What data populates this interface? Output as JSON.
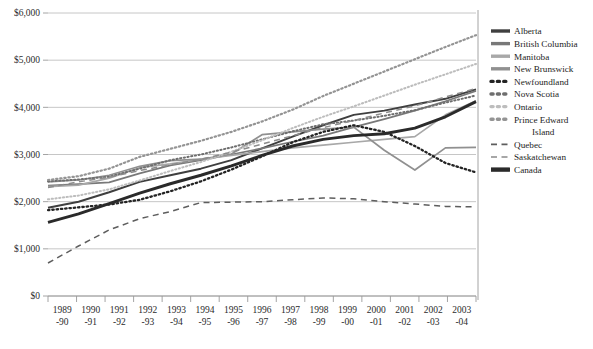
{
  "chart_data": {
    "type": "line",
    "title": "",
    "xlabel": "",
    "ylabel": "",
    "ylim": [
      0,
      6000
    ],
    "ytick_values": [
      0,
      1000,
      2000,
      3000,
      4000,
      5000,
      6000
    ],
    "ytick_labels": [
      "$0",
      "$1,000",
      "$2,000",
      "$3,000",
      "$4,000",
      "$5,000",
      "$6,000"
    ],
    "grid": true,
    "legend_position": "right",
    "categories": [
      "1989–90",
      "1990–91",
      "1991–92",
      "1992–93",
      "1993–94",
      "1994–95",
      "1995–96",
      "1996–97",
      "1997–98",
      "1998–99",
      "1999–00",
      "2000–01",
      "2001–02",
      "2002–03",
      "2003–04"
    ],
    "xtick_top": [
      "1989",
      "1990",
      "1991",
      "1992",
      "1993",
      "1994",
      "1995",
      "1996",
      "1997",
      "1998",
      "1999",
      "2000",
      "2001",
      "2002",
      "2003"
    ],
    "xtick_bottom": [
      "-90",
      "-91",
      "-92",
      "-93",
      "-94",
      "-95",
      "-96",
      "-97",
      "-98",
      "-99",
      "-00",
      "-01",
      "-02",
      "-03",
      "-04"
    ],
    "series": [
      {
        "name": "Alberta",
        "style": "solid",
        "color": "#3f3f3f",
        "width": 2.0,
        "values": [
          1870,
          2000,
          2200,
          2420,
          2560,
          2700,
          2880,
          3130,
          3380,
          3620,
          3840,
          3930,
          4060,
          4180,
          4380
        ]
      },
      {
        "name": "British Columbia",
        "style": "solid",
        "color": "#787878",
        "width": 1.7,
        "values": [
          2340,
          2370,
          2410,
          2600,
          2770,
          2880,
          3000,
          3130,
          3270,
          3400,
          3580,
          3750,
          3930,
          4130,
          4350
        ]
      },
      {
        "name": "Manitoba",
        "style": "solid",
        "color": "#a8a8a8",
        "width": 1.7,
        "values": [
          2320,
          2350,
          2500,
          2720,
          2800,
          2900,
          2980,
          3060,
          3140,
          3200,
          3260,
          3320,
          3380,
          3840,
          4140
        ]
      },
      {
        "name": "New Brunswick",
        "style": "solid",
        "color": "#909090",
        "width": 1.7,
        "values": [
          2420,
          2460,
          2560,
          2750,
          2870,
          2900,
          3010,
          3420,
          3480,
          3540,
          3580,
          3090,
          2670,
          3140,
          3150
        ]
      },
      {
        "name": "Newfoundland",
        "style": "dotted",
        "color": "#242424",
        "width": 2.3,
        "values": [
          1820,
          1880,
          1940,
          2040,
          2220,
          2430,
          2680,
          2960,
          3260,
          3480,
          3620,
          3480,
          3180,
          2820,
          2620
        ]
      },
      {
        "name": "Nova Scotia",
        "style": "dotted",
        "color": "#6e6e6e",
        "width": 2.0,
        "values": [
          2430,
          2470,
          2530,
          2700,
          2880,
          3000,
          3150,
          3320,
          3490,
          3640,
          3720,
          3820,
          3940,
          4100,
          4250
        ]
      },
      {
        "name": "Ontario",
        "style": "dotted",
        "color": "#bdbdbd",
        "width": 2.0,
        "values": [
          2050,
          2130,
          2260,
          2450,
          2650,
          2840,
          3060,
          3300,
          3560,
          3800,
          4020,
          4250,
          4480,
          4700,
          4920
        ]
      },
      {
        "name": "Prince Edward Island",
        "style": "dotted",
        "color": "#949494",
        "width": 2.2,
        "values": [
          2460,
          2540,
          2700,
          2950,
          3120,
          3290,
          3480,
          3700,
          3950,
          4240,
          4500,
          4760,
          5020,
          5280,
          5530
        ]
      },
      {
        "name": "Quebec",
        "style": "dashed",
        "color": "#5e5e5e",
        "width": 1.5,
        "values": [
          700,
          1060,
          1400,
          1640,
          1790,
          1980,
          1990,
          2000,
          2040,
          2080,
          2060,
          2000,
          1950,
          1900,
          1890
        ]
      },
      {
        "name": "Saskatchewan",
        "style": "dashed",
        "color": "#8b8b8b",
        "width": 1.5,
        "values": [
          2300,
          2420,
          2520,
          2660,
          2780,
          2900,
          3050,
          3220,
          3400,
          3570,
          3720,
          3880,
          4030,
          4220,
          4400
        ]
      },
      {
        "name": "Canada",
        "style": "solid",
        "color": "#2a2a2a",
        "width": 2.9,
        "values": [
          1560,
          1740,
          1960,
          2180,
          2380,
          2560,
          2760,
          2980,
          3180,
          3320,
          3400,
          3440,
          3560,
          3800,
          4120
        ]
      }
    ],
    "legend_entries": [
      {
        "label": "Alberta",
        "style": "solid",
        "color": "#3f3f3f",
        "width": 3.4
      },
      {
        "label": "British Columbia",
        "style": "solid",
        "color": "#787878",
        "width": 3.4
      },
      {
        "label": "Manitoba",
        "style": "solid",
        "color": "#a8a8a8",
        "width": 3.4
      },
      {
        "label": "New Brunswick",
        "style": "solid",
        "color": "#909090",
        "width": 3.4
      },
      {
        "label": "Newfoundland",
        "style": "dotted",
        "color": "#242424",
        "width": 3.4
      },
      {
        "label": "Nova Scotia",
        "style": "dotted",
        "color": "#6e6e6e",
        "width": 3.4
      },
      {
        "label": "Ontario",
        "style": "dotted",
        "color": "#bdbdbd",
        "width": 3.4
      },
      {
        "label": "Prince Edward",
        "label2": "Island",
        "style": "dotted",
        "color": "#949494",
        "width": 3.4
      },
      {
        "label": "Quebec",
        "style": "dashed",
        "color": "#5e5e5e",
        "width": 1.6
      },
      {
        "label": "Saskatchewan",
        "style": "dashed",
        "color": "#8b8b8b",
        "width": 1.6
      },
      {
        "label": "Canada",
        "style": "solid",
        "color": "#2a2a2a",
        "width": 4.4
      }
    ],
    "caption": "",
    "gridline_color": "#b8b8b8",
    "axis_color": "#9a9a9a"
  }
}
